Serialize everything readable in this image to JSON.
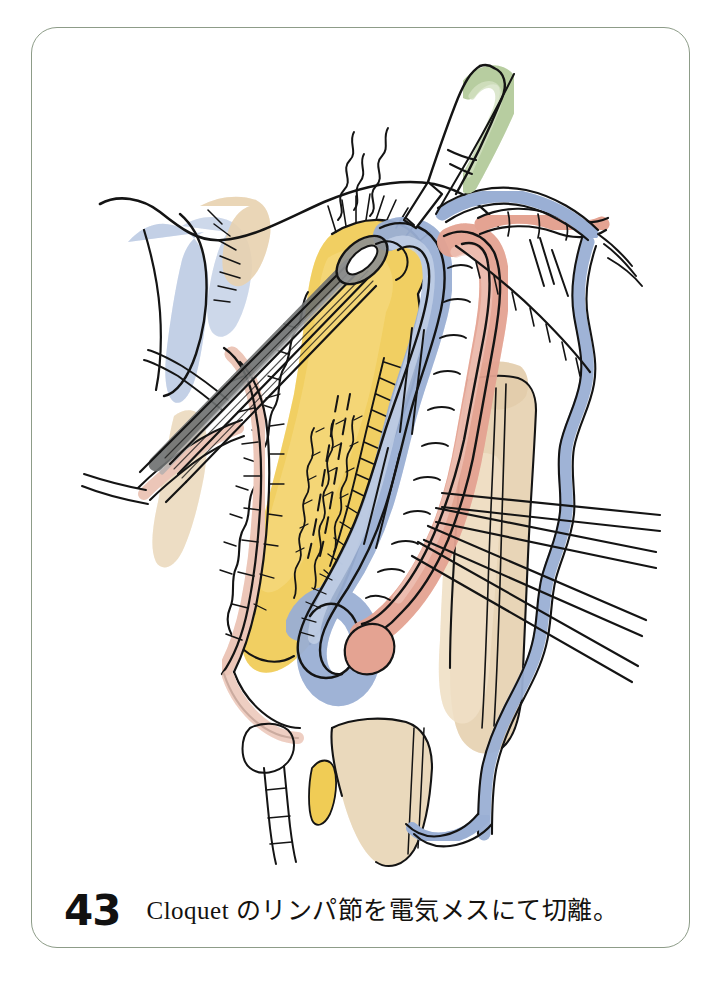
{
  "figure": {
    "number": "43",
    "caption": "Cloquet のリンパ節を電気メスにて切離。",
    "frame_color": "#8d9c88",
    "page_background": "#ffffff"
  },
  "palette": {
    "ink": "#141414",
    "lymph_fat_yellow": "#f0cc55",
    "lymph_fat_yellow_light": "#f7e08d",
    "vein_blue": "#9aafd4",
    "vein_blue_light": "#c3d0e8",
    "artery_pink": "#e4a392",
    "artery_pink_light": "#f0c5ba",
    "muscle_tan": "#e7d3b4",
    "muscle_tan_light": "#f2e6d2",
    "cautery_green": "#b7cda0",
    "cautery_green_light": "#d2e0c0",
    "instrument_gray": "#6d6f70",
    "instrument_gray_light": "#a9abac",
    "paper_white": "#ffffff"
  },
  "illustration": {
    "title": "Surgical illustration: dissection of Cloquet's lymph node with electrocautery",
    "elements": [
      {
        "name": "electrocautery-pencil",
        "label": "電気メス",
        "color": "#b7cda0"
      },
      {
        "name": "smoke-wisps",
        "label": "煙",
        "color": "#141414"
      },
      {
        "name": "cloquet-lymph-node",
        "label": "Cloquet のリンパ節",
        "color": "#f0cc55"
      },
      {
        "name": "forceps",
        "label": "鉗子",
        "color": "#6d6f70"
      },
      {
        "name": "femoral-vein",
        "label": "大腿静脈",
        "color": "#9aafd4"
      },
      {
        "name": "femoral-artery",
        "label": "大腿動脈",
        "color": "#e4a392"
      },
      {
        "name": "inguinal-ligament",
        "label": "鼠径靱帯",
        "color": "#9aafd4"
      },
      {
        "name": "muscle-bed",
        "label": "筋",
        "color": "#e7d3b4"
      },
      {
        "name": "fatty-lymphatic-tissue",
        "label": "脂肪リンパ組織",
        "color": "#f0cc55"
      },
      {
        "name": "vessel-loops",
        "label": "ベッセルループ",
        "color": "#ffffff"
      },
      {
        "name": "great-saphenous-vein",
        "label": "大伏在静脈",
        "color": "#9aafd4"
      },
      {
        "name": "branch-vessels",
        "label": "分枝血管",
        "color": "#e4a392"
      }
    ]
  }
}
